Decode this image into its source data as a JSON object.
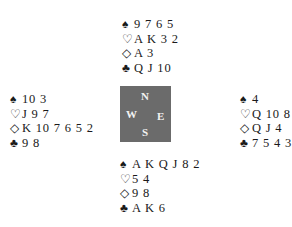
{
  "suits": {
    "spades": "♠",
    "hearts": "♡",
    "diamonds": "◇",
    "clubs": "♣"
  },
  "hands": {
    "north": {
      "spades": "9 7 6 5",
      "hearts": "A K 3 2",
      "diamonds": "A 3",
      "clubs": "Q J 10"
    },
    "west": {
      "spades": "10 3",
      "hearts": "J 9 7",
      "diamonds": "K 10 7 6 5 2",
      "clubs": "9 8"
    },
    "east": {
      "spades": "4",
      "hearts": "Q 10 8 6",
      "diamonds": "Q J 4",
      "clubs": "7 5 4 3 2"
    },
    "south": {
      "spades": "A K Q J 8 2",
      "hearts": "5 4",
      "diamonds": "9 8",
      "clubs": "A K 6"
    }
  },
  "compass": {
    "n": "N",
    "w": "W",
    "e": "E",
    "s": "S",
    "color": "#6b6b6b"
  }
}
